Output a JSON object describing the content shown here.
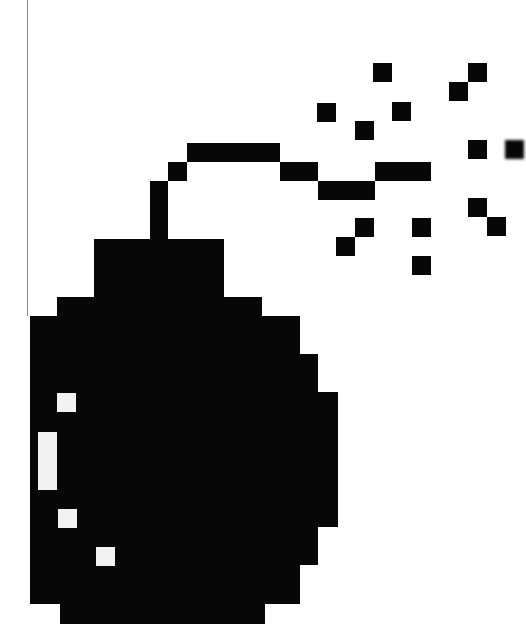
{
  "image": {
    "subject": "pixel-art bomb with lit fuse and sparks",
    "colors": {
      "background": "#ffffff",
      "ink": "#070707",
      "highlight": "#f2f2f2",
      "rule_line": "#8a8a8a"
    },
    "grid_unit_px": 19
  },
  "left_rule": {
    "x": 27,
    "y": 0,
    "height": 316
  },
  "fuse": [
    {
      "x": 150,
      "y": 181,
      "w": 18,
      "h": 59
    },
    {
      "x": 168,
      "y": 162,
      "w": 19,
      "h": 19
    },
    {
      "x": 187,
      "y": 143,
      "w": 93,
      "h": 19
    },
    {
      "x": 280,
      "y": 162,
      "w": 38,
      "h": 19
    },
    {
      "x": 318,
      "y": 181,
      "w": 57,
      "h": 19
    },
    {
      "x": 375,
      "y": 162,
      "w": 56,
      "h": 19
    }
  ],
  "cap": {
    "x": 94,
    "y": 239,
    "w": 130,
    "h": 58
  },
  "body_rows": [
    {
      "x": 57,
      "y": 297,
      "w": 205,
      "h": 19
    },
    {
      "x": 30,
      "y": 316,
      "w": 270,
      "h": 38
    },
    {
      "x": 30,
      "y": 354,
      "w": 288,
      "h": 38
    },
    {
      "x": 30,
      "y": 392,
      "w": 308,
      "h": 135
    },
    {
      "x": 30,
      "y": 527,
      "w": 288,
      "h": 38
    },
    {
      "x": 30,
      "y": 565,
      "w": 270,
      "h": 39
    },
    {
      "x": 60,
      "y": 604,
      "w": 205,
      "h": 20
    }
  ],
  "highlights": [
    {
      "x": 57,
      "y": 393,
      "w": 19,
      "h": 19
    },
    {
      "x": 38,
      "y": 432,
      "w": 19,
      "h": 58
    },
    {
      "x": 58,
      "y": 509,
      "w": 19,
      "h": 19
    },
    {
      "x": 96,
      "y": 547,
      "w": 19,
      "h": 19
    }
  ],
  "sparks": [
    {
      "x": 373,
      "y": 63
    },
    {
      "x": 317,
      "y": 103
    },
    {
      "x": 392,
      "y": 102
    },
    {
      "x": 355,
      "y": 121
    },
    {
      "x": 468,
      "y": 63
    },
    {
      "x": 449,
      "y": 82
    },
    {
      "x": 468,
      "y": 140
    },
    {
      "x": 505,
      "y": 140,
      "blurred": true
    },
    {
      "x": 355,
      "y": 218
    },
    {
      "x": 336,
      "y": 237
    },
    {
      "x": 412,
      "y": 218
    },
    {
      "x": 412,
      "y": 256
    },
    {
      "x": 468,
      "y": 198
    },
    {
      "x": 487,
      "y": 217
    }
  ]
}
